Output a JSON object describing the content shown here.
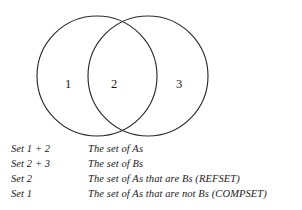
{
  "diagram": {
    "type": "venn",
    "title": "",
    "circles": [
      {
        "name": "circle-a",
        "cx": 97,
        "cy": 76,
        "r": 60
      },
      {
        "name": "circle-b",
        "cx": 148,
        "cy": 76,
        "r": 60
      }
    ],
    "region_labels": [
      {
        "id": "1",
        "text": "1",
        "meaning": "A only"
      },
      {
        "id": "2",
        "text": "2",
        "meaning": "A intersect B"
      },
      {
        "id": "3",
        "text": "3",
        "meaning": "B only"
      }
    ]
  },
  "legend": {
    "rows": [
      {
        "set": "Set 1 + 2",
        "description": "The set of As"
      },
      {
        "set": "Set 2 + 3",
        "description": "The set of Bs"
      },
      {
        "set": "Set 2",
        "description": "The set of As that are Bs (REFSET)"
      },
      {
        "set": "Set 1",
        "description": "The set of As that are not Bs (COMPSET)"
      }
    ]
  },
  "colors": {
    "background": "#ffffff",
    "stroke": "#2b2b2b",
    "text": "#1b1b1b"
  }
}
